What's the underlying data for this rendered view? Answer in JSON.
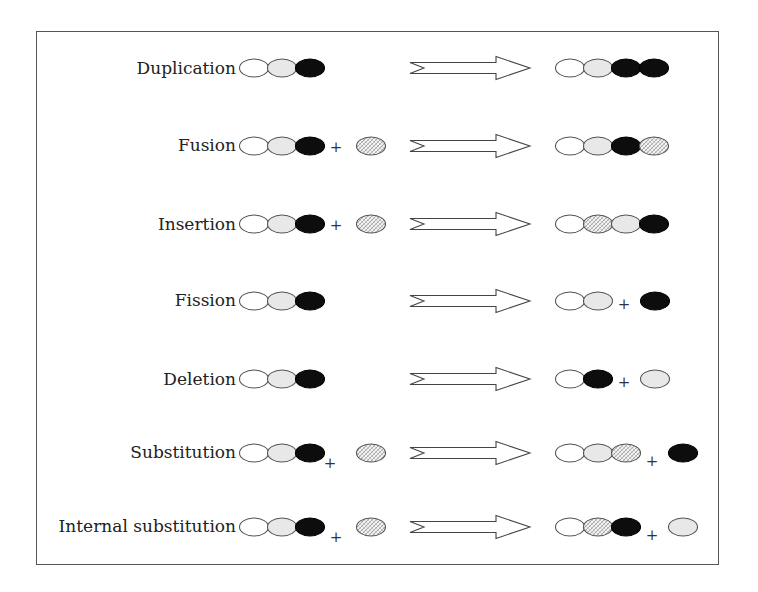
{
  "diagram": {
    "type": "domain-rearrangement-events",
    "legend_colors": {
      "white": "#ffffff",
      "light": "#e8e8e8",
      "black": "#0d0d0d",
      "hatched": "#d9d9d9"
    },
    "rows": [
      {
        "label": "Duplication",
        "before": [
          "white",
          "light",
          "black"
        ],
        "before_extra": null,
        "after": [
          "white",
          "light",
          "black",
          "black"
        ],
        "after_extra": null
      },
      {
        "label": "Fusion",
        "before": [
          "white",
          "light",
          "black"
        ],
        "before_extra": "hatched",
        "after": [
          "white",
          "light",
          "black",
          "hatched"
        ],
        "after_extra": null
      },
      {
        "label": "Insertion",
        "before": [
          "white",
          "light",
          "black"
        ],
        "before_extra": "hatched",
        "after": [
          "white",
          "hatched",
          "light",
          "black"
        ],
        "after_extra": null
      },
      {
        "label": "Fission",
        "before": [
          "white",
          "light",
          "black"
        ],
        "before_extra": null,
        "after": [
          "white",
          "light"
        ],
        "after_extra": "black"
      },
      {
        "label": "Deletion",
        "before": [
          "white",
          "light",
          "black"
        ],
        "before_extra": null,
        "after": [
          "white",
          "black"
        ],
        "after_extra": "light"
      },
      {
        "label": "Substitution",
        "before": [
          "white",
          "light",
          "black"
        ],
        "before_extra": "hatched",
        "after": [
          "white",
          "light",
          "hatched"
        ],
        "after_extra": "black"
      },
      {
        "label": "Internal substitution",
        "before": [
          "white",
          "light",
          "black"
        ],
        "before_extra": "hatched",
        "after": [
          "white",
          "hatched",
          "black"
        ],
        "after_extra": "light"
      }
    ],
    "plus_sign": "+"
  }
}
